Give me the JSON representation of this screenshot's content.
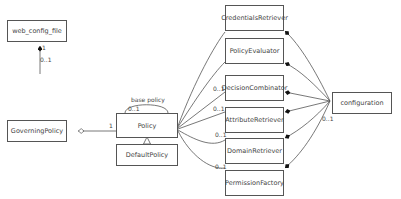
{
  "diagram": {
    "type": "UML class diagram",
    "classes": {
      "web_config_file": "web_config_file",
      "governing_policy": "GoverningPolicy",
      "policy": "Policy",
      "default_policy": "DefaultPolicy",
      "credentials_retriever": "CredentialsRetriever",
      "policy_evaluator": "PolicyEvaluator",
      "decision_combinator": "DecisionCombinator",
      "attribute_retriever": "AttributeRetriever",
      "domain_retriever": "DomainRetriever",
      "permission_factory": "PermissionFactory",
      "configuration": "configuration"
    },
    "labels": {
      "web_config_mult_top": "1",
      "web_config_mult_bottom": "0..1",
      "governing_policy_mult": "1",
      "base_policy_role": "base policy",
      "base_policy_mult": "0..1",
      "decision_mult": "0..1",
      "attribute_mult": "0..1",
      "domain_mult": "0..1",
      "permission_mult": "0..1",
      "configuration_mult": "0..1"
    }
  }
}
